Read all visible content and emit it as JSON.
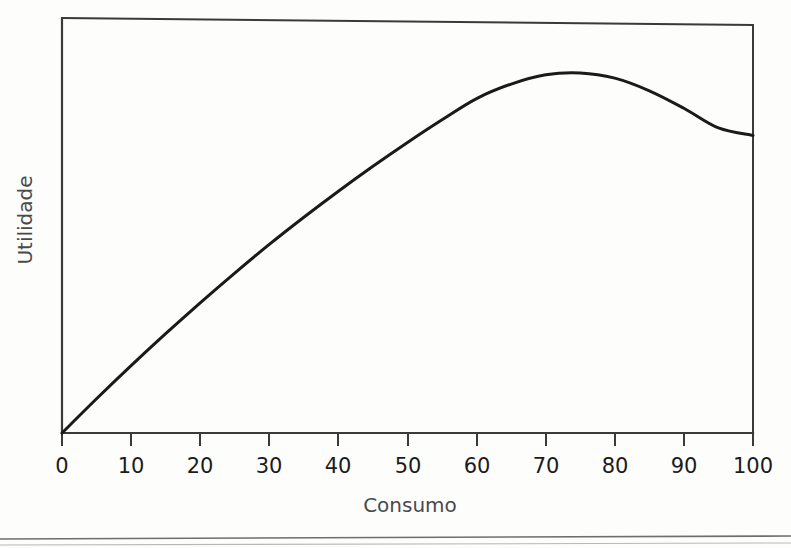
{
  "figure": {
    "background_color": "#fdfdfc",
    "ink_color": "#1a1a1a",
    "axis_color": "#3a3a38"
  },
  "chart_data": {
    "type": "line",
    "title": "",
    "subtitle": "",
    "xlabel": "Consumo",
    "ylabel": "Utilidade",
    "xlim": [
      0,
      100
    ],
    "ylim": [
      0,
      1
    ],
    "grid": false,
    "legend": false,
    "legend_position": "none",
    "xticks": [
      0,
      10,
      20,
      30,
      40,
      50,
      60,
      70,
      80,
      90,
      100
    ],
    "xtick_labels": [
      "0",
      "10",
      "20",
      "30",
      "40",
      "50",
      "60",
      "70",
      "80",
      "90",
      "100"
    ],
    "yticks": [],
    "ytick_labels": [],
    "annotations": [],
    "series": [
      {
        "name": "Utilidade total",
        "x": [
          0,
          5,
          10,
          15,
          20,
          25,
          30,
          35,
          40,
          45,
          50,
          55,
          60,
          65,
          70,
          75,
          80,
          85,
          90,
          95,
          100
        ],
        "values": [
          0.0,
          0.092,
          0.181,
          0.267,
          0.35,
          0.43,
          0.507,
          0.58,
          0.65,
          0.717,
          0.781,
          0.842,
          0.899,
          0.938,
          0.963,
          0.968,
          0.954,
          0.92,
          0.873,
          0.82,
          0.8
        ],
        "peak_x": 70,
        "peak_y": 0.968,
        "endpoint_x": 100,
        "endpoint_y": 0.8,
        "color": "#1a1a1a",
        "line_width": 3,
        "marker": "none"
      }
    ]
  },
  "labels": {
    "x_axis_title": "Consumo",
    "y_axis_title": "Utilidade"
  }
}
